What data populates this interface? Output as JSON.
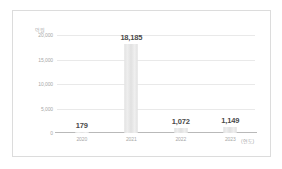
{
  "chart_data": {
    "type": "bar",
    "title": "",
    "subtitle": "",
    "xlabel": "(연도)",
    "ylabel": "억원",
    "categories": [
      "2020",
      "2021",
      "2022",
      "2023"
    ],
    "values": [
      179,
      18185,
      1072,
      1149
    ],
    "value_labels": [
      "179",
      "18,185",
      "1,072",
      "1,149"
    ],
    "ylim": [
      0,
      20000
    ],
    "yticks": [
      20000,
      15000,
      10000,
      5000,
      0
    ],
    "ytick_labels": [
      "20,000",
      "15,000",
      "10,000",
      "5,000",
      "0"
    ],
    "grid": true,
    "legend": false,
    "bar_color": "#e6e6e6",
    "axis_color": "#b9b9b9",
    "grid_color": "#e9e9e9",
    "label_color": "#4a4a4a",
    "tick_color": "#a8a8a8"
  }
}
